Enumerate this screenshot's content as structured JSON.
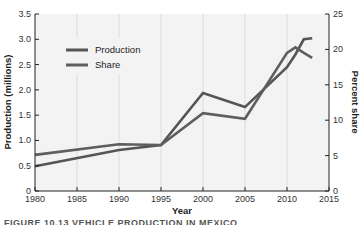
{
  "chart_data": {
    "type": "line",
    "title": "",
    "xlabel": "Year",
    "ylabel": "Production (millions)",
    "y2label": "Percent share",
    "xlim": [
      1980,
      2015
    ],
    "ylim": [
      0,
      3.5
    ],
    "y2lim": [
      0,
      25
    ],
    "x_ticks": [
      "1980",
      "1985",
      "1990",
      "1995",
      "2000",
      "2005",
      "2010",
      "2015"
    ],
    "y_ticks": [
      "0",
      "0.5",
      "1.0",
      "1.5",
      "2.0",
      "2.5",
      "3.0",
      "3.5"
    ],
    "y2_ticks": [
      "0",
      "5",
      "10",
      "15",
      "20",
      "25"
    ],
    "grid": "vertical",
    "legend_position": "upper-left",
    "series": [
      {
        "name": "Production",
        "axis": "left",
        "x": [
          1980,
          1990,
          1995,
          2000,
          2005,
          2010,
          2011,
          2012,
          2013
        ],
        "values": [
          0.49,
          0.81,
          0.91,
          1.94,
          1.66,
          2.45,
          2.7,
          3.0,
          3.02
        ]
      },
      {
        "name": "Share",
        "axis": "right",
        "x": [
          1980,
          1990,
          1995,
          2000,
          2005,
          2010,
          2011,
          2012,
          2013
        ],
        "values": [
          5.1,
          6.6,
          6.5,
          11.0,
          10.2,
          19.5,
          20.3,
          19.5,
          18.8
        ]
      }
    ]
  },
  "legend": {
    "items": [
      {
        "label": "Production"
      },
      {
        "label": "Share"
      }
    ]
  },
  "caption": "FIGURE 10.13 VEHICLE PRODUCTION IN MEXICO"
}
